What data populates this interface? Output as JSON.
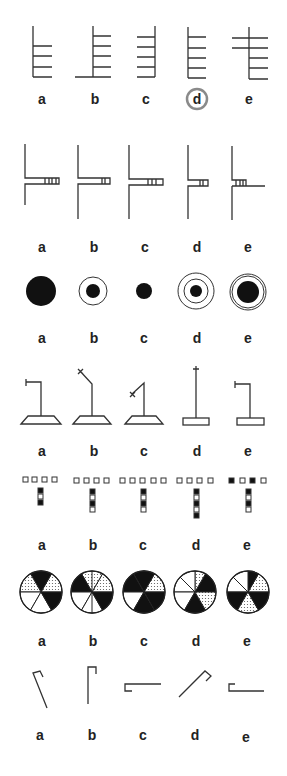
{
  "figure": {
    "selected_answer_row1": "d",
    "colors": {
      "ink": "#333333",
      "selection_ring": "#8a8a8a",
      "background": "#ffffff"
    }
  },
  "rows": [
    {
      "id": "row-1-ladders",
      "options": [
        {
          "label": "a"
        },
        {
          "label": "b"
        },
        {
          "label": "c"
        },
        {
          "label": "d",
          "circled": true
        },
        {
          "label": "e"
        }
      ]
    },
    {
      "id": "row-2-branches",
      "options": [
        {
          "label": "a"
        },
        {
          "label": "b"
        },
        {
          "label": "c"
        },
        {
          "label": "d"
        },
        {
          "label": "e"
        }
      ]
    },
    {
      "id": "row-3-circles",
      "options": [
        {
          "label": "a"
        },
        {
          "label": "b"
        },
        {
          "label": "c"
        },
        {
          "label": "d"
        },
        {
          "label": "e"
        }
      ]
    },
    {
      "id": "row-4-stands",
      "options": [
        {
          "label": "a"
        },
        {
          "label": "b"
        },
        {
          "label": "c"
        },
        {
          "label": "d"
        },
        {
          "label": "e"
        }
      ]
    },
    {
      "id": "row-5-squares",
      "options": [
        {
          "label": "a"
        },
        {
          "label": "b"
        },
        {
          "label": "c"
        },
        {
          "label": "d"
        },
        {
          "label": "e"
        }
      ]
    },
    {
      "id": "row-6-pies",
      "options": [
        {
          "label": "a"
        },
        {
          "label": "b"
        },
        {
          "label": "c"
        },
        {
          "label": "d"
        },
        {
          "label": "e"
        }
      ]
    },
    {
      "id": "row-7-hooks",
      "options": [
        {
          "label": "a"
        },
        {
          "label": "b"
        },
        {
          "label": "c"
        },
        {
          "label": "d"
        },
        {
          "label": "e"
        }
      ]
    }
  ]
}
